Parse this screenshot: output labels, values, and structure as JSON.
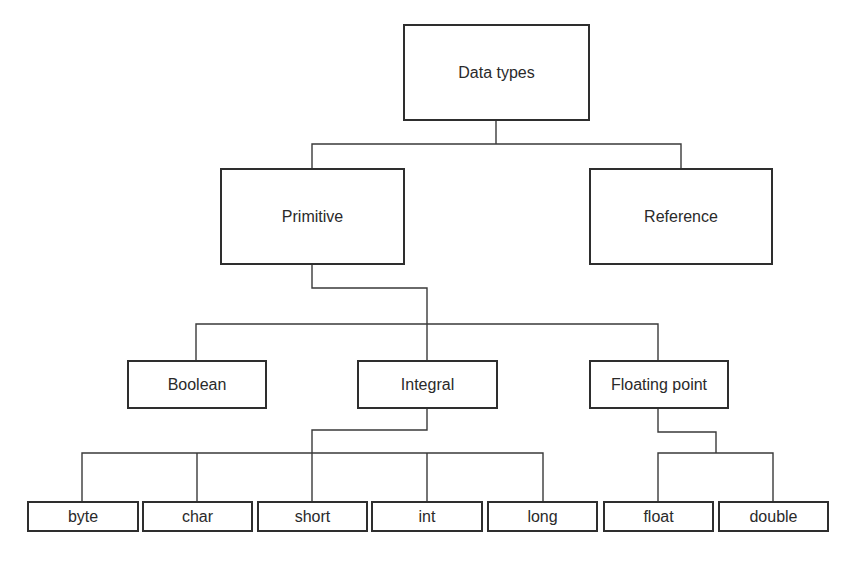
{
  "diagram": {
    "nodes": {
      "root": "Data types",
      "primitive": "Primitive",
      "reference": "Reference",
      "boolean": "Boolean",
      "integral": "Integral",
      "floating_point": "Floating point",
      "byte": "byte",
      "char": "char",
      "short": "short",
      "int": "int",
      "long": "long",
      "float": "float",
      "double": "double"
    },
    "edges": [
      [
        "Data types",
        "Primitive"
      ],
      [
        "Data types",
        "Reference"
      ],
      [
        "Primitive",
        "Boolean"
      ],
      [
        "Primitive",
        "Integral"
      ],
      [
        "Primitive",
        "Floating point"
      ],
      [
        "Integral",
        "byte"
      ],
      [
        "Integral",
        "char"
      ],
      [
        "Integral",
        "short"
      ],
      [
        "Integral",
        "int"
      ],
      [
        "Integral",
        "long"
      ],
      [
        "Floating point",
        "float"
      ],
      [
        "Floating point",
        "double"
      ]
    ],
    "colors": {
      "line": "#3a3a3a",
      "box_border": "#2e2e2e",
      "text": "#2a2a2a",
      "background": "#ffffff"
    }
  }
}
